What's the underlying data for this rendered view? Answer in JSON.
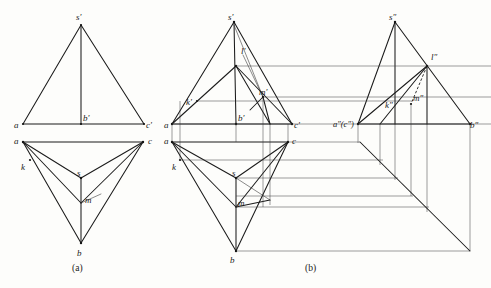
{
  "figure": {
    "captions": {
      "a": "(a)",
      "b": "(b)"
    },
    "panel_a": {
      "name": "two-view projection",
      "front_view": {
        "name": "front-view",
        "labels": [
          {
            "id": "s-prime",
            "text": "s'",
            "x": 76,
            "y": 20
          },
          {
            "id": "a",
            "text": "a",
            "x": 14,
            "y": 128
          },
          {
            "id": "b-prime",
            "text": "b'",
            "x": 83,
            "y": 120
          },
          {
            "id": "c-prime",
            "text": "c'",
            "x": 146,
            "y": 128
          }
        ],
        "points": {
          "s_prime": [
            81,
            25
          ],
          "a": [
            23,
            124
          ],
          "b_prime": [
            81,
            124
          ],
          "c_prime": [
            144,
            124
          ]
        }
      },
      "top_view": {
        "name": "top-view",
        "labels": [
          {
            "id": "a",
            "text": "a",
            "x": 14,
            "y": 143
          },
          {
            "id": "k",
            "text": "k",
            "x": 21,
            "y": 168
          },
          {
            "id": "c",
            "text": "c",
            "x": 148,
            "y": 143
          },
          {
            "id": "s",
            "text": "s",
            "x": 79,
            "y": 175
          },
          {
            "id": "m",
            "text": "m",
            "x": 85,
            "y": 203
          },
          {
            "id": "b",
            "text": "b",
            "x": 79,
            "y": 255
          }
        ],
        "points": {
          "a": [
            23,
            142
          ],
          "c": [
            143,
            142
          ],
          "s": [
            81,
            178
          ],
          "b": [
            81,
            243
          ],
          "k": [
            30,
            160
          ],
          "m": [
            81,
            203
          ]
        }
      }
    },
    "panel_b": {
      "name": "three-view projection with profile view",
      "front_view": {
        "name": "front-view",
        "labels": [
          {
            "id": "s-prime",
            "text": "s'",
            "x": 229,
            "y": 20
          },
          {
            "id": "l-prime",
            "text": "l'",
            "x": 241,
            "y": 52
          },
          {
            "id": "k-prime",
            "text": "k'",
            "x": 188,
            "y": 105
          },
          {
            "id": "m-prime",
            "text": "m'",
            "x": 260,
            "y": 96
          },
          {
            "id": "a",
            "text": "a",
            "x": 166,
            "y": 128
          },
          {
            "id": "b-prime",
            "text": "b'",
            "x": 238,
            "y": 120
          },
          {
            "id": "c-prime",
            "text": "c'",
            "x": 294,
            "y": 128
          }
        ]
      },
      "profile_view": {
        "name": "profile-view",
        "labels": [
          {
            "id": "s-double-prime",
            "text": "s″",
            "x": 391,
            "y": 20
          },
          {
            "id": "l-double-prime",
            "text": "l″",
            "x": 431,
            "y": 57
          },
          {
            "id": "k-double-prime",
            "text": "k″",
            "x": 387,
            "y": 106
          },
          {
            "id": "m-double-prime",
            "text": "m″",
            "x": 415,
            "y": 102
          },
          {
            "id": "ac-double-prime",
            "text": "a″(c″)",
            "x": 333,
            "y": 127
          },
          {
            "id": "b-double-prime",
            "text": "b″",
            "x": 472,
            "y": 128
          }
        ]
      },
      "top_view": {
        "name": "top-view",
        "labels": [
          {
            "id": "a",
            "text": "a",
            "x": 166,
            "y": 143
          },
          {
            "id": "k",
            "text": "k",
            "x": 173,
            "y": 168
          },
          {
            "id": "c",
            "text": "c",
            "x": 299,
            "y": 143
          },
          {
            "id": "s",
            "text": "s",
            "x": 234,
            "y": 175
          },
          {
            "id": "m",
            "text": "m",
            "x": 238,
            "y": 204
          },
          {
            "id": "b",
            "text": "b",
            "x": 232,
            "y": 262
          }
        ]
      }
    },
    "colors": {
      "line": "#1b1b1b",
      "thin_line": "#3a3a3a",
      "background": "#fdfdfb",
      "text": "#1a1a1a"
    }
  }
}
